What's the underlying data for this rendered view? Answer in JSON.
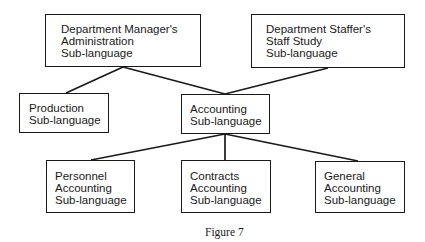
{
  "diagram": {
    "type": "hierarchy",
    "nodes": {
      "manager": {
        "lines": [
          "Department Manager's",
          "Administration",
          "Sub-language"
        ]
      },
      "staffer": {
        "lines": [
          "Department Staffer's",
          "Staff Study",
          "Sub-language"
        ]
      },
      "production": {
        "lines": [
          "Production",
          "Sub-language"
        ]
      },
      "accounting": {
        "lines": [
          "Accounting",
          "Sub-language"
        ]
      },
      "personnel": {
        "lines": [
          "Personnel",
          "Accounting",
          "Sub-language"
        ]
      },
      "contracts": {
        "lines": [
          "Contracts",
          "Accounting",
          "Sub-language"
        ]
      },
      "general": {
        "lines": [
          "General",
          "Accounting",
          "Sub-language"
        ]
      }
    },
    "edges": [
      [
        "manager",
        "production"
      ],
      [
        "manager",
        "accounting"
      ],
      [
        "staffer",
        "accounting"
      ],
      [
        "accounting",
        "personnel"
      ],
      [
        "accounting",
        "contracts"
      ],
      [
        "accounting",
        "general"
      ]
    ],
    "line_color": "#1a1a1a"
  },
  "caption": "Figure 7"
}
